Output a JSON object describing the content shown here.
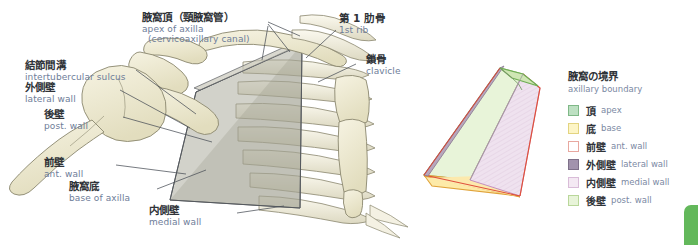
{
  "figure": {
    "title_note": "Axilla (axillary cavity) boundaries — anterior view of shoulder girdle and rib cage with schematic pyramid"
  },
  "labels": [
    {
      "id": "apex-of-axilla",
      "jp": "腋窩頂（頸腋窩管）",
      "en": "apex of axilla",
      "en2": "(cervicoaxillary canal)"
    },
    {
      "id": "first-rib",
      "jp": "第 1 肋骨",
      "en": "1st rib",
      "en2": ""
    },
    {
      "id": "clavicle",
      "jp": "鎖骨",
      "en": "clavicle",
      "en2": ""
    },
    {
      "id": "intertubercular-sulcus",
      "jp": "結節間溝",
      "en": "intertubercular sulcus",
      "en2": ""
    },
    {
      "id": "lateral-wall",
      "jp": "外側壁",
      "en": "lateral wall",
      "en2": ""
    },
    {
      "id": "posterior-wall",
      "jp": "後壁",
      "en": "post. wall",
      "en2": ""
    },
    {
      "id": "anterior-wall",
      "jp": "前壁",
      "en": "ant. wall",
      "en2": ""
    },
    {
      "id": "base-of-axilla",
      "jp": "腋窩底",
      "en": "base of axilla",
      "en2": ""
    },
    {
      "id": "medial-wall",
      "jp": "内側壁",
      "en": "medial wall",
      "en2": ""
    }
  ],
  "legend": {
    "title_jp": "腋窩の境界",
    "title_en": "axillary boundary",
    "items": [
      {
        "jp": "頂",
        "en": "apex",
        "fill": "#bde0c2",
        "stroke": "#7fb887"
      },
      {
        "jp": "底",
        "en": "base",
        "fill": "#fdf5c6",
        "stroke": "#e3d480"
      },
      {
        "jp": "前壁",
        "en": "ant. wall",
        "fill": "#ffffff",
        "stroke": "#e8a8a0"
      },
      {
        "jp": "外側壁",
        "en": "lateral wall",
        "fill": "#a293ad",
        "stroke": "#7e7089"
      },
      {
        "jp": "内側壁",
        "en": "medial wall",
        "fill": "#f4e9f3",
        "stroke": "#d9bcd8"
      },
      {
        "jp": "後壁",
        "en": "post. wall",
        "fill": "#e8f4d9",
        "stroke": "#b9d79a"
      }
    ]
  },
  "colors": {
    "bone_fill": "#eeead0",
    "bone_edge": "#8a876e",
    "wedge_fill": "#b8b5a8",
    "leader_line": "#4a4f57",
    "jp_text": "#2f3338",
    "en_text": "#6e7d99",
    "corner_tab": "#63b85b"
  }
}
